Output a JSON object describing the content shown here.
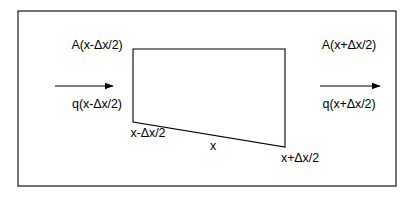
{
  "figure": {
    "background_color": "#ffffff",
    "line_color": "#000000",
    "text_color": "#000000",
    "outer_frame": {
      "name": "outer-border",
      "x": 18,
      "y": 11,
      "width": 378,
      "height": 175
    },
    "control_volume": {
      "name": "control-volume-quadrilateral",
      "points": "133,49 285,49 285,147 133,122",
      "vertices": {
        "top_left": [
          133,
          49
        ],
        "top_right": [
          285,
          49
        ],
        "bottom_right": [
          285,
          147
        ],
        "bottom_left": [
          133,
          122
        ]
      }
    },
    "arrows": [
      {
        "name": "inflow-arrow",
        "x1": 55,
        "y1": 86,
        "x2": 113,
        "y2": 86,
        "direction": "right"
      },
      {
        "name": "outflow-arrow",
        "x1": 320,
        "y1": 86,
        "x2": 380,
        "y2": 86,
        "direction": "right"
      }
    ]
  },
  "labels": {
    "area_left": "A(x-Δx/2)",
    "flux_left": "q(x-Δx/2)",
    "area_right": "A(x+Δx/2)",
    "flux_right": "q(x+Δx/2)",
    "x_minus": "x-Δx/2",
    "x_center": "x",
    "x_plus": "x+Δx/2"
  }
}
